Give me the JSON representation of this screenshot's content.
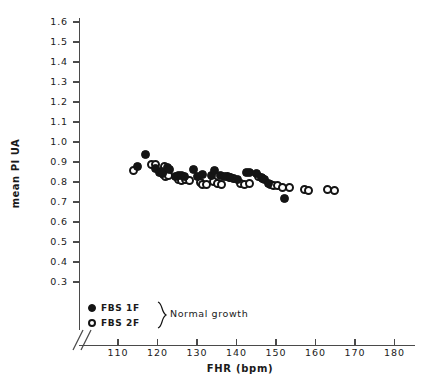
{
  "chart_data": {
    "type": "scatter",
    "title": "",
    "xlabel": "FHR (bpm)",
    "ylabel": "mean PI UA",
    "xlim": [
      103,
      183
    ],
    "ylim": [
      0.28,
      1.65
    ],
    "xticks": [
      110,
      120,
      130,
      140,
      150,
      160,
      170,
      180
    ],
    "yticks": [
      0.3,
      0.4,
      0.5,
      0.6,
      0.7,
      0.8,
      0.9,
      1.0,
      1.1,
      1.2,
      1.3,
      1.4,
      1.5,
      1.6
    ],
    "xtick_labels": [
      "110",
      "120",
      "130",
      "140",
      "150",
      "160",
      "170",
      "180"
    ],
    "ytick_labels": [
      "0.3",
      "0.4",
      "0.5",
      "0.6",
      "0.7",
      "0.8",
      "0.9",
      "1.0",
      "1.1",
      "1.2",
      "1.3",
      "1.4",
      "1.5",
      "1.6"
    ],
    "grid": false,
    "axis_break": true,
    "legend_position": "lower-left",
    "legend_group_label": "Normal growth",
    "series": [
      {
        "name": "FBS 1F",
        "marker": "filled-circle",
        "color": "#141414",
        "points": [
          [
            114.9,
            0.877
          ],
          [
            117.0,
            0.937
          ],
          [
            119.6,
            0.868
          ],
          [
            120.5,
            0.848
          ],
          [
            121.0,
            0.855
          ],
          [
            121.2,
            0.842
          ],
          [
            122.5,
            0.872
          ],
          [
            123.0,
            0.862
          ],
          [
            124.6,
            0.826
          ],
          [
            125.4,
            0.831
          ],
          [
            126.1,
            0.832
          ],
          [
            126.8,
            0.827
          ],
          [
            129.2,
            0.862
          ],
          [
            130.1,
            0.827
          ],
          [
            131.4,
            0.838
          ],
          [
            133.6,
            0.835
          ],
          [
            134.5,
            0.858
          ],
          [
            136.0,
            0.834
          ],
          [
            136.9,
            0.829
          ],
          [
            138.4,
            0.821
          ],
          [
            140.3,
            0.813
          ],
          [
            142.5,
            0.848
          ],
          [
            143.4,
            0.848
          ],
          [
            145.1,
            0.842
          ],
          [
            146.3,
            0.825
          ],
          [
            147.0,
            0.811
          ],
          [
            148.1,
            0.795
          ],
          [
            152.2,
            0.717
          ]
        ]
      },
      {
        "name": "FBS 2F",
        "marker": "open-circle",
        "color": "#141414",
        "points": [
          [
            114.0,
            0.858
          ],
          [
            118.5,
            0.886
          ],
          [
            119.5,
            0.886
          ],
          [
            121.7,
            0.878
          ],
          [
            121.5,
            0.836
          ],
          [
            122.0,
            0.828
          ],
          [
            122.8,
            0.831
          ],
          [
            125.2,
            0.812
          ],
          [
            126.0,
            0.81
          ],
          [
            127.0,
            0.812
          ],
          [
            128.0,
            0.809
          ],
          [
            131.0,
            0.798
          ],
          [
            131.5,
            0.786
          ],
          [
            132.4,
            0.786
          ],
          [
            134.2,
            0.805
          ],
          [
            135.2,
            0.794
          ],
          [
            136.2,
            0.79
          ],
          [
            137.6,
            0.828
          ],
          [
            138.2,
            0.822
          ],
          [
            139.3,
            0.818
          ],
          [
            141.0,
            0.795
          ],
          [
            142.0,
            0.79
          ],
          [
            143.3,
            0.793
          ],
          [
            145.5,
            0.826
          ],
          [
            146.6,
            0.818
          ],
          [
            148.5,
            0.788
          ],
          [
            149.3,
            0.783
          ],
          [
            150.4,
            0.781
          ],
          [
            151.6,
            0.775
          ],
          [
            153.4,
            0.772
          ],
          [
            157.1,
            0.762
          ],
          [
            158.2,
            0.757
          ],
          [
            163.0,
            0.762
          ],
          [
            164.8,
            0.76
          ]
        ]
      }
    ]
  },
  "legend": {
    "rows": [
      {
        "label": "FBS 1F",
        "marker": "filled-circle"
      },
      {
        "label": "FBS 2F",
        "marker": "open-circle"
      }
    ],
    "group_label": "Normal growth"
  },
  "axes": {
    "x_title": "FHR (bpm)",
    "y_title": "mean PI UA"
  }
}
